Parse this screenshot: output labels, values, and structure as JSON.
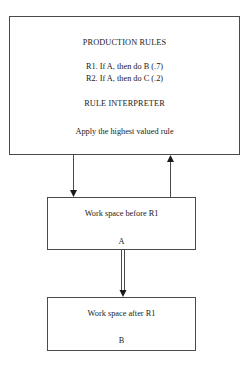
{
  "diagram": {
    "top_box": {
      "title": "PRODUCTION RULES",
      "rules": [
        "R1. If A, then do B (.7)",
        "R2. If A, then do C (.2)"
      ],
      "interpreter_title": "RULE INTERPRETER",
      "interpreter_text": "Apply the highest valued rule"
    },
    "middle_box": {
      "label": "Work space before R1",
      "state": "A"
    },
    "bottom_box": {
      "label": "Work space after R1",
      "state": "B"
    },
    "edges": [
      {
        "from": "top_box",
        "to": "middle_box",
        "style": "single-arrow"
      },
      {
        "from": "middle_box",
        "to": "top_box",
        "style": "single-arrow"
      },
      {
        "from": "middle_box",
        "to": "bottom_box",
        "style": "double-line-arrow"
      }
    ],
    "colors": {
      "line": "#4a4a4a",
      "text": "#1a1a1a",
      "background": "#ffffff"
    }
  }
}
